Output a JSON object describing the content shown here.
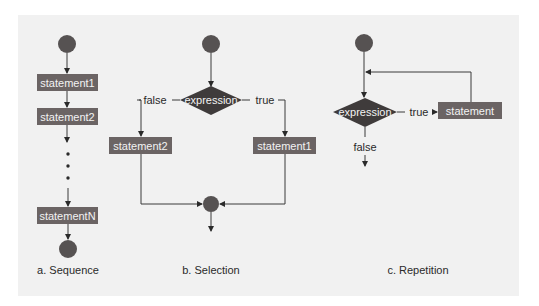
{
  "sequence": {
    "statements": [
      "statement1",
      "statement2",
      "statementN"
    ],
    "caption": "a. Sequence"
  },
  "selection": {
    "condition": "expression",
    "false_label": "false",
    "true_label": "true",
    "false_statement": "statement2",
    "true_statement": "statement1",
    "caption": "b. Selection"
  },
  "repetition": {
    "condition": "expression",
    "true_label": "true",
    "false_label": "false",
    "statement": "statement",
    "caption": "c. Repetition"
  },
  "colors": {
    "box": "#6b6464",
    "diamond": "#3f3b3b",
    "node": "#565252",
    "panel": "#f1f1f1"
  }
}
